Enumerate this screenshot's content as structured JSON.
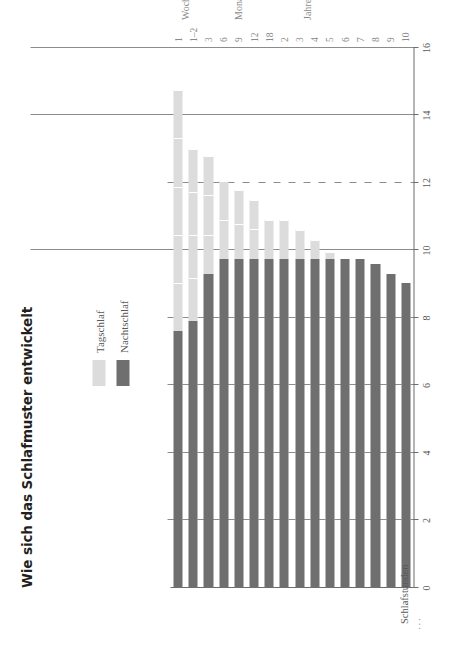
{
  "title": "Wie sich das Schlafmuster entwickelt",
  "legend": {
    "position": "top-left-inside",
    "items": [
      {
        "label": "Tagschlaf",
        "color": "#dcdcdc"
      },
      {
        "label": "Nachtschlaf",
        "color": "#6f6f70"
      }
    ]
  },
  "axes": {
    "value_axis_label": "Schlafstunden",
    "value_axis_truncation_marks": "···",
    "value_ticks": [
      0,
      2,
      4,
      6,
      8,
      10,
      12,
      14,
      16
    ],
    "value_min": 0,
    "value_max": 16,
    "category_axis_label": "Alter",
    "category_groups": [
      "Wochen",
      "Monate",
      "Jahre"
    ]
  },
  "chart_data": {
    "type": "bar",
    "subtype": "stacked-horizontal",
    "title": "Wie sich das Schlafmuster entwickelt",
    "xlabel": "Alter",
    "ylabel": "Schlafstunden",
    "ylim": [
      0,
      16
    ],
    "grid": true,
    "legend_position": "top-left",
    "categories": [
      "1",
      "1–2",
      "3",
      "6",
      "9",
      "12",
      "18",
      "2",
      "3",
      "4",
      "5",
      "6",
      "7",
      "8",
      "9",
      "10"
    ],
    "category_groups": [
      {
        "name": "Wochen",
        "categories": [
          "1",
          "1–2"
        ]
      },
      {
        "name": "Monate",
        "categories": [
          "3",
          "6",
          "9",
          "12",
          "18"
        ]
      },
      {
        "name": "Jahre",
        "categories": [
          "2",
          "3",
          "4",
          "5",
          "6",
          "7",
          "8",
          "9",
          "10"
        ]
      }
    ],
    "series": [
      {
        "name": "Nachtschlaf",
        "color": "#6f6f70",
        "values": [
          7.6,
          7.9,
          9.3,
          9.75,
          9.75,
          9.75,
          9.75,
          9.75,
          9.75,
          9.75,
          9.75,
          9.75,
          9.75,
          9.6,
          9.3,
          9.05
        ]
      },
      {
        "name": "Tagschlaf",
        "color": "#dcdcdc",
        "segments_per_category": [
          5,
          4,
          3,
          2,
          2,
          2,
          1,
          1,
          1,
          1,
          1,
          0,
          0,
          0,
          0,
          0
        ],
        "values": [
          7.15,
          5.1,
          3.5,
          2.3,
          2.05,
          1.75,
          1.15,
          1.15,
          0.85,
          0.55,
          0.2,
          0,
          0,
          0,
          0,
          0
        ]
      }
    ],
    "totals": [
      14.75,
      13.0,
      12.8,
      12.05,
      11.8,
      11.5,
      10.9,
      10.9,
      10.6,
      10.3,
      9.95,
      9.75,
      9.75,
      9.6,
      9.3,
      9.05
    ]
  }
}
